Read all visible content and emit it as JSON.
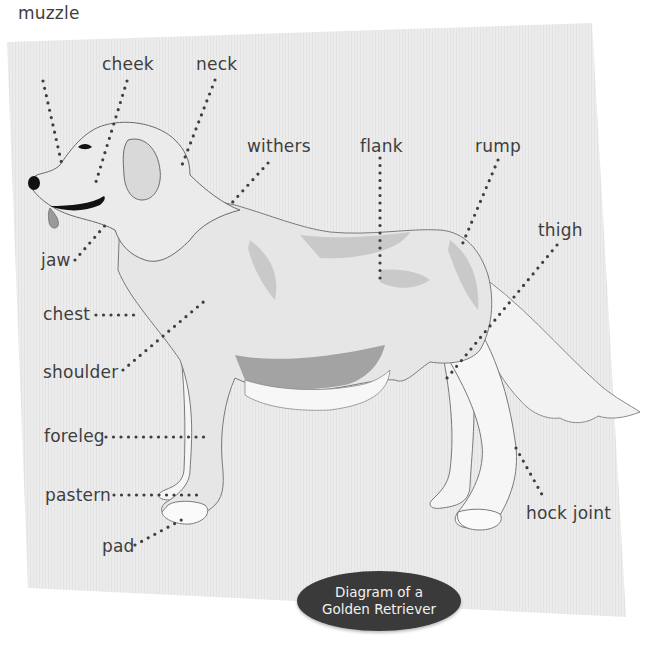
{
  "diagram": {
    "title_lines": [
      "Diagram of a",
      "Golden Retriever"
    ],
    "subject": "Golden Retriever",
    "colors": {
      "paper": "#ececec",
      "ink": "#3e3e3e",
      "badge": "#3a3a3a",
      "badge_text": "#f2f2f2",
      "fur_light": "#e4e4e4",
      "fur_mid": "#c8c8c8",
      "fur_dark": "#8f8f8f"
    },
    "labels": [
      {
        "id": "muzzle",
        "text": "muzzle"
      },
      {
        "id": "cheek",
        "text": "cheek"
      },
      {
        "id": "neck",
        "text": "neck"
      },
      {
        "id": "withers",
        "text": "withers"
      },
      {
        "id": "flank",
        "text": "flank"
      },
      {
        "id": "rump",
        "text": "rump"
      },
      {
        "id": "thigh",
        "text": "thigh"
      },
      {
        "id": "jaw",
        "text": "jaw"
      },
      {
        "id": "chest",
        "text": "chest"
      },
      {
        "id": "shoulder",
        "text": "shoulder"
      },
      {
        "id": "foreleg",
        "text": "foreleg"
      },
      {
        "id": "pastern",
        "text": "pastern"
      },
      {
        "id": "pad",
        "text": "pad"
      },
      {
        "id": "hock-joint",
        "text": "hock joint"
      }
    ]
  }
}
